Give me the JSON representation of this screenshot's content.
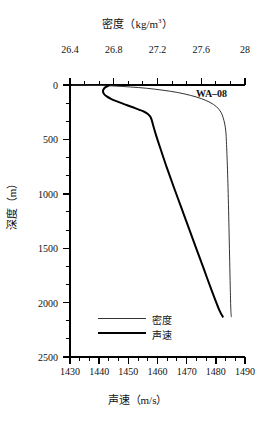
{
  "chart_data": {
    "type": "line",
    "title_main": "密度（kg/m",
    "title_sup": "3",
    "title_tail": "）",
    "xlabel_bottom": "声速（m/s）",
    "xlabel_top": "密度（kg/m³）",
    "ylabel": "深度（m）",
    "annotation": "WA–08",
    "grid": false,
    "legend_position": "bottom-left-inside",
    "axes": {
      "top": {
        "name": "密度",
        "unit": "kg/m^3",
        "min": 26.4,
        "max": 28.0,
        "ticks": [
          "26.4",
          "26.8",
          "27.2",
          "27.6",
          "28"
        ],
        "tick_values": [
          26.4,
          26.8,
          27.2,
          27.6,
          28.0
        ],
        "minor_per_interval": 2
      },
      "bottom": {
        "name": "声速",
        "unit": "m/s",
        "min": 1430,
        "max": 1490,
        "ticks": [
          "1430",
          "1440",
          "1450",
          "1460",
          "1470",
          "1480",
          "1490"
        ],
        "tick_values": [
          1430,
          1440,
          1450,
          1460,
          1470,
          1480,
          1490
        ],
        "minor_per_interval": 2
      },
      "left": {
        "name": "深度",
        "unit": "m",
        "min": 0,
        "max": 2500,
        "inverted": true,
        "ticks": [
          "0",
          "500",
          "1000",
          "1500",
          "2000",
          "2500"
        ],
        "tick_values": [
          0,
          500,
          1000,
          1500,
          2000,
          2500
        ],
        "minor_per_interval": 2
      }
    },
    "series": [
      {
        "name": "密度",
        "legend_label": "密度",
        "axis": "top",
        "color": "#333333",
        "width": 1,
        "x_unit": "kg/m^3",
        "points": [
          [
            26.42,
            0
          ],
          [
            26.55,
            2
          ],
          [
            26.7,
            5
          ],
          [
            26.82,
            10
          ],
          [
            26.95,
            18
          ],
          [
            27.1,
            30
          ],
          [
            27.25,
            48
          ],
          [
            27.38,
            68
          ],
          [
            27.5,
            95
          ],
          [
            27.6,
            125
          ],
          [
            27.68,
            160
          ],
          [
            27.74,
            200
          ],
          [
            27.78,
            250
          ],
          [
            27.8,
            300
          ],
          [
            27.815,
            360
          ],
          [
            27.825,
            430
          ],
          [
            27.83,
            520
          ],
          [
            27.835,
            640
          ],
          [
            27.84,
            780
          ],
          [
            27.845,
            950
          ],
          [
            27.85,
            1150
          ],
          [
            27.855,
            1380
          ],
          [
            27.86,
            1620
          ],
          [
            27.865,
            1850
          ],
          [
            27.87,
            2050
          ],
          [
            27.875,
            2130
          ]
        ]
      },
      {
        "name": "声速",
        "legend_label": "声速",
        "axis": "bottom",
        "color": "#000000",
        "width": 2,
        "x_unit": "m/s",
        "points": [
          [
            1443.5,
            0
          ],
          [
            1443.0,
            8
          ],
          [
            1442.2,
            20
          ],
          [
            1441.6,
            35
          ],
          [
            1441.3,
            55
          ],
          [
            1441.6,
            80
          ],
          [
            1442.6,
            105
          ],
          [
            1444.2,
            130
          ],
          [
            1446.5,
            155
          ],
          [
            1449.0,
            180
          ],
          [
            1451.5,
            205
          ],
          [
            1453.8,
            228
          ],
          [
            1455.6,
            248
          ],
          [
            1456.8,
            268
          ],
          [
            1457.5,
            290
          ],
          [
            1458.0,
            320
          ],
          [
            1458.6,
            380
          ],
          [
            1459.6,
            470
          ],
          [
            1461.2,
            600
          ],
          [
            1463.2,
            760
          ],
          [
            1465.6,
            940
          ],
          [
            1468.2,
            1130
          ],
          [
            1470.8,
            1320
          ],
          [
            1473.4,
            1510
          ],
          [
            1476.0,
            1700
          ],
          [
            1478.6,
            1890
          ],
          [
            1481.2,
            2070
          ],
          [
            1482.4,
            2130
          ]
        ]
      }
    ],
    "legend": [
      {
        "label": "密度",
        "color": "#333333",
        "width": 1
      },
      {
        "label": "声速",
        "color": "#000000",
        "width": 2
      }
    ]
  }
}
